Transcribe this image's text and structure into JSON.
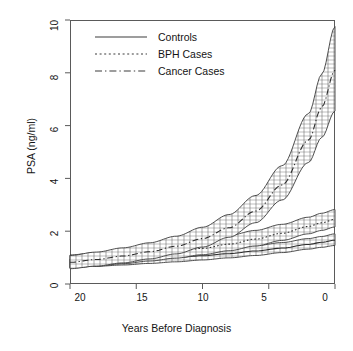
{
  "chart_data": {
    "type": "line",
    "title": "",
    "xlabel": "Years Before Diagnosis",
    "ylabel": "PSA (ng/ml)",
    "xlim": [
      20,
      0
    ],
    "ylim": [
      0,
      10
    ],
    "xticks": [
      "20",
      "15",
      "10",
      "5",
      "0"
    ],
    "xtick_values": [
      20,
      15,
      10,
      5,
      0
    ],
    "yticks": [
      "0",
      "2",
      "4",
      "6",
      "8",
      "10"
    ],
    "ytick_values": [
      0,
      2,
      4,
      6,
      8,
      10
    ],
    "x_axis_reversed": true,
    "grid": false,
    "legend_position": "top-left",
    "x": [
      20,
      18,
      16,
      14,
      12,
      10,
      8,
      6,
      4,
      2,
      1,
      0
    ],
    "series": [
      {
        "name": "Controls",
        "line_style": "solid",
        "values": [
          0.78,
          0.83,
          0.88,
          0.94,
          1.0,
          1.07,
          1.15,
          1.25,
          1.36,
          1.5,
          1.58,
          1.66
        ],
        "lower": [
          0.62,
          0.67,
          0.72,
          0.78,
          0.84,
          0.91,
          0.99,
          1.08,
          1.19,
          1.32,
          1.39,
          1.46
        ],
        "upper": [
          0.95,
          1.0,
          1.05,
          1.11,
          1.18,
          1.26,
          1.35,
          1.45,
          1.57,
          1.72,
          1.8,
          1.9
        ]
      },
      {
        "name": "BPH Cases",
        "line_style": "dotted",
        "values": [
          0.83,
          0.91,
          1.0,
          1.1,
          1.22,
          1.35,
          1.51,
          1.7,
          1.92,
          2.18,
          2.32,
          2.45
        ],
        "lower": [
          0.6,
          0.68,
          0.77,
          0.87,
          0.98,
          1.11,
          1.26,
          1.44,
          1.65,
          1.9,
          2.03,
          2.16
        ],
        "upper": [
          1.1,
          1.19,
          1.29,
          1.4,
          1.53,
          1.67,
          1.84,
          2.03,
          2.26,
          2.53,
          2.68,
          2.82
        ]
      },
      {
        "name": "Cancer Cases",
        "line_style": "dash-dot",
        "values": [
          0.82,
          0.93,
          1.06,
          1.22,
          1.43,
          1.72,
          2.13,
          2.76,
          3.75,
          5.45,
          6.7,
          8.1
        ],
        "lower": [
          0.58,
          0.68,
          0.8,
          0.95,
          1.14,
          1.4,
          1.77,
          2.32,
          3.18,
          4.6,
          5.55,
          6.55
        ],
        "upper": [
          1.08,
          1.21,
          1.37,
          1.56,
          1.81,
          2.15,
          2.63,
          3.35,
          4.48,
          6.45,
          7.95,
          9.75
        ]
      }
    ],
    "legend": [
      {
        "label": "Controls",
        "style": "solid"
      },
      {
        "label": "BPH Cases",
        "style": "dotted"
      },
      {
        "label": "Cancer Cases",
        "style": "dash-dot"
      }
    ],
    "band_note": "Each series is drawn as a hatched confidence band between lower and upper with the mean curve inside."
  }
}
